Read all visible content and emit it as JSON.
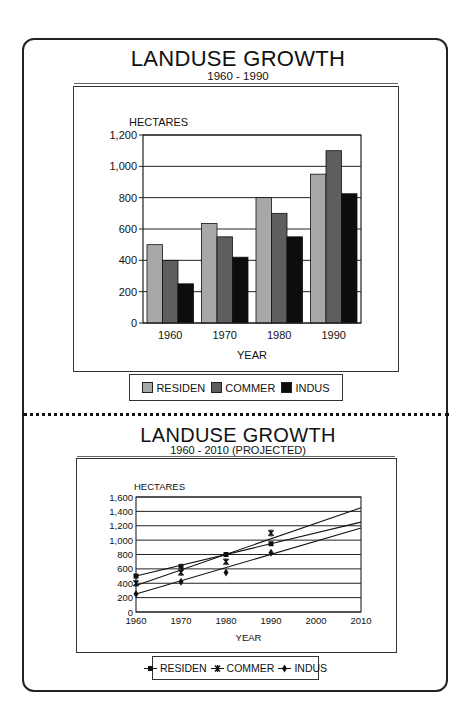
{
  "top": {
    "title": "LANDUSE GROWTH",
    "subtitle": "1960 - 1990",
    "legend": [
      {
        "label": "RESIDEN",
        "color": "#a8a8a8"
      },
      {
        "label": "COMMER",
        "color": "#5e5e5e"
      },
      {
        "label": "INDUS",
        "color": "#0d0d0d"
      }
    ]
  },
  "bottom": {
    "title": "LANDUSE GROWTH",
    "subtitle": "1960 - 2010 (PROJECTED)",
    "legend": [
      {
        "label": "RESIDEN",
        "marker": "square"
      },
      {
        "label": "COMMER",
        "marker": "asterisk"
      },
      {
        "label": "INDUS",
        "marker": "diamond"
      }
    ]
  },
  "chart_data": [
    {
      "type": "bar",
      "title": "LANDUSE GROWTH",
      "subtitle": "1960 - 1990",
      "xlabel": "YEAR",
      "ylabel": "HECTARES",
      "categories": [
        "1960",
        "1970",
        "1980",
        "1990"
      ],
      "series": [
        {
          "name": "RESIDEN",
          "values": [
            500,
            635,
            800,
            950
          ],
          "color": "#a8a8a8"
        },
        {
          "name": "COMMER",
          "values": [
            400,
            550,
            700,
            1100
          ],
          "color": "#5e5e5e"
        },
        {
          "name": "INDUS",
          "values": [
            250,
            420,
            550,
            825
          ],
          "color": "#0d0d0d"
        }
      ],
      "yticks": [
        "0",
        "200",
        "400",
        "600",
        "800",
        "1,000",
        "1,200"
      ],
      "ylim": [
        0,
        1200
      ],
      "grid": true,
      "legend_position": "bottom"
    },
    {
      "type": "line",
      "title": "LANDUSE GROWTH",
      "subtitle": "1960 - 2010 (PROJECTED)",
      "xlabel": "YEAR",
      "ylabel": "HECTARES",
      "x": [
        1960,
        1970,
        1980,
        1990,
        2000,
        2010
      ],
      "xticks": [
        "1960",
        "1970",
        "1980",
        "1990",
        "2000",
        "2010"
      ],
      "series": [
        {
          "name": "RESIDEN",
          "marker": "square",
          "points": [
            [
              1960,
              500
            ],
            [
              1970,
              635
            ],
            [
              1980,
              800
            ],
            [
              1990,
              950
            ]
          ],
          "trend": [
            [
              1960,
              500
            ],
            [
              2010,
              1250
            ]
          ]
        },
        {
          "name": "COMMER",
          "marker": "asterisk",
          "points": [
            [
              1960,
              400
            ],
            [
              1970,
              550
            ],
            [
              1980,
              700
            ],
            [
              1990,
              1100
            ]
          ],
          "trend": [
            [
              1960,
              370
            ],
            [
              2010,
              1450
            ]
          ]
        },
        {
          "name": "INDUS",
          "marker": "diamond",
          "points": [
            [
              1960,
              250
            ],
            [
              1970,
              420
            ],
            [
              1980,
              550
            ],
            [
              1990,
              825
            ]
          ],
          "trend": [
            [
              1960,
              250
            ],
            [
              2010,
              1170
            ]
          ]
        }
      ],
      "yticks": [
        "0",
        "200",
        "400",
        "600",
        "800",
        "1,000",
        "1,200",
        "1,400",
        "1,600"
      ],
      "ylim": [
        0,
        1600
      ],
      "xlim": [
        1960,
        2010
      ],
      "grid": true,
      "legend_position": "bottom"
    }
  ]
}
